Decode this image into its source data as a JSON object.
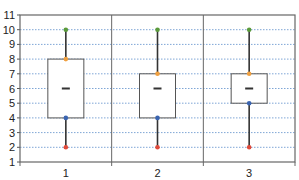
{
  "chart_data": {
    "type": "boxplot",
    "title": "",
    "xlabel": "",
    "ylabel": "",
    "categories": [
      "1",
      "2",
      "3"
    ],
    "ylim": [
      1,
      11
    ],
    "yticks": [
      "1",
      "2",
      "3",
      "4",
      "5",
      "6",
      "7",
      "8",
      "9",
      "10",
      "11"
    ],
    "grid": {
      "horizontal": true,
      "style": "dotted"
    },
    "legend": null,
    "boxes": [
      {
        "category": "1",
        "min": 2,
        "q1": 4,
        "median": 6,
        "q3": 8,
        "max": 10
      },
      {
        "category": "2",
        "min": 2,
        "q1": 4,
        "median": 6,
        "q3": 7,
        "max": 10
      },
      {
        "category": "3",
        "min": 2,
        "q1": 5,
        "median": 6,
        "q3": 7,
        "max": 10
      }
    ],
    "marker_colors": {
      "max": "#5a9a3a",
      "q3": "#f0a040",
      "q1": "#3a64b0",
      "min": "#e04a3a"
    }
  }
}
